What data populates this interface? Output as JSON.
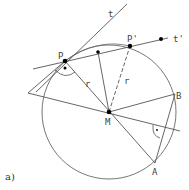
{
  "figure": {
    "caption": "a)",
    "points": {
      "P": "P",
      "P_prime": "P'",
      "M": "M",
      "A": "A",
      "B": "B"
    },
    "lines": {
      "t": "t",
      "t_prime": "t'"
    },
    "radius_labels": [
      "r",
      "r"
    ],
    "right_angle_marker": "·",
    "colors": {
      "stroke": "#555555",
      "point": "#000000",
      "background": "#ffffff"
    }
  }
}
